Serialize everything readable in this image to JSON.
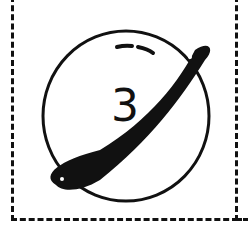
{
  "icon": {
    "name": "planet-icon",
    "number": "3"
  },
  "colors": {
    "stroke": "#111111",
    "background": "#ffffff"
  }
}
